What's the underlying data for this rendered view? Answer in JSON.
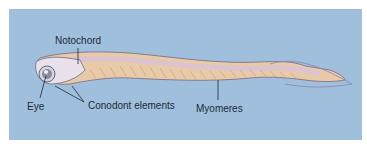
{
  "figure": {
    "background_color": "#9fbfdc",
    "labels": {
      "notochord": "Notochord",
      "eye": "Eye",
      "conodont_elements": "Conodont elements",
      "myomeres": "Myomeres"
    }
  }
}
